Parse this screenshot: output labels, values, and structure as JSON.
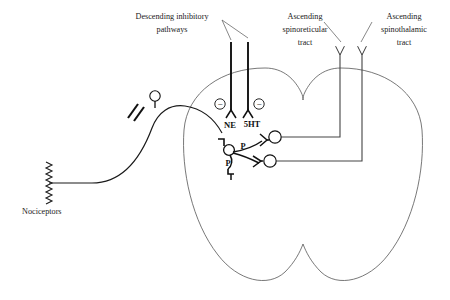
{
  "diagram": {
    "background_color": "#ffffff",
    "stroke_color": "#333333",
    "ink_color": "#111111",
    "labels": {
      "descending_line1": "Descending inhibitory",
      "descending_line2": "pathways",
      "spinoreticular_line1": "Ascending",
      "spinoreticular_line2": "spinoreticular",
      "spinoreticular_line3": "tract",
      "spinothalamic_line1": "Ascending",
      "spinothalamic_line2": "spinothalamic",
      "spinothalamic_line3": "tract",
      "nociceptors": "Nociceptors",
      "ne": "NE",
      "fivehT": "5HT",
      "substance_p_upper": "P",
      "substance_p_lower": "P",
      "minus_left": "−",
      "minus_right": "−"
    },
    "structures": {
      "spinal_cord": "spinal-cord-outline",
      "dorsal_root_ganglion": "dorsal-root-ganglion",
      "primary_afferent": "primary-afferent-fiber",
      "free_nerve_endings": "nociceptor-free-endings",
      "axon_break": "axon-interruption-marks",
      "interneuron": "inhibitory-interneuron",
      "projection_neuron_upper": "spinoreticular-projection-neuron",
      "projection_neuron_lower": "spinothalamic-projection-neuron",
      "descending_fiber_ne": "descending-noradrenergic-fiber",
      "descending_fiber_5ht": "descending-serotonergic-fiber"
    }
  }
}
